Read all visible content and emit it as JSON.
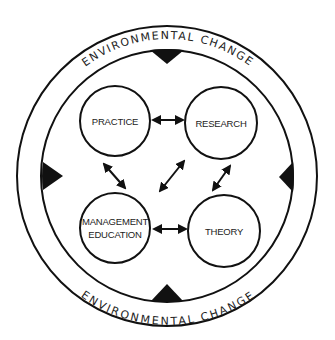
{
  "diagram": {
    "ring_label_top": "ENVIRONMENTAL CHANGE",
    "ring_label_bottom": "ENVIRONMENTAL CHANGE",
    "nodes": [
      {
        "id": "practice",
        "label_lines": [
          "PRACTICE"
        ]
      },
      {
        "id": "research",
        "label_lines": [
          "RESEARCH"
        ]
      },
      {
        "id": "management-education",
        "label_lines": [
          "MANAGEMENT",
          "EDUCATION"
        ]
      },
      {
        "id": "theory",
        "label_lines": [
          "THEORY"
        ]
      }
    ],
    "edges": [
      {
        "from": "practice",
        "to": "research",
        "type": "bidirectional"
      },
      {
        "from": "practice",
        "to": "management-education",
        "type": "bidirectional"
      },
      {
        "from": "research",
        "to": "theory",
        "type": "bidirectional"
      },
      {
        "from": "research",
        "to": "management-education",
        "type": "bidirectional"
      },
      {
        "from": "management-education",
        "to": "theory",
        "type": "bidirectional"
      }
    ],
    "pressure_markers": [
      "top",
      "right",
      "bottom",
      "left"
    ],
    "colors": {
      "stroke": "#111111",
      "background": "#ffffff"
    }
  }
}
